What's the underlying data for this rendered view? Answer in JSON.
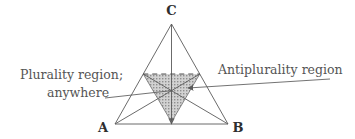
{
  "figure": {
    "background_color": "#ffffff",
    "line_color": "#5a5a5a",
    "shade_fill": "#c9c9c9",
    "text_color": "#555555",
    "vertex_label_color": "#2e2e2e",
    "vertices": [
      {
        "id": "A",
        "label": "A",
        "x": 115,
        "y": 124,
        "label_x": 103,
        "label_y": 131
      },
      {
        "id": "B",
        "label": "B",
        "x": 228,
        "y": 124,
        "label_x": 235,
        "label_y": 131
      },
      {
        "id": "C",
        "label": "C",
        "x": 171.5,
        "y": 24,
        "label_x": 171.5,
        "label_y": 13
      }
    ],
    "midpoints": [
      {
        "id": "M_AC",
        "x": 143.25,
        "y": 74
      },
      {
        "id": "M_BC",
        "x": 199.75,
        "y": 74
      },
      {
        "id": "M_AB",
        "x": 171.5,
        "y": 124
      }
    ],
    "centroid": {
      "x": 171.5,
      "y": 90.7
    },
    "shaded_region": {
      "name": "antiplurality-region",
      "points": "143.25,74 199.75,74 171.5,122",
      "fill": "#c9c9c9",
      "hatch": "dotted-stipple"
    },
    "dashed_segment": {
      "name": "midline-dashed",
      "x1": 143.25,
      "y1": 74,
      "x2": 199.75,
      "y2": 74,
      "dash": "5,4"
    },
    "annotations": [
      {
        "id": "plurality",
        "line1": "Plurality region;",
        "line2": "anywhere",
        "line1_x": 20,
        "line1_y": 75,
        "line2_x": 47,
        "line2_y": 93,
        "leader": {
          "x1": 105,
          "y1": 97,
          "x2": 171,
          "y2": 90.7,
          "arrow": true
        }
      },
      {
        "id": "antiplurality",
        "line1": "Antiplurality region",
        "line1_x": 218,
        "line1_y": 72,
        "leader": {
          "x1": 330,
          "y1": 79,
          "x2": 186,
          "y2": 88,
          "arrow": true
        }
      }
    ]
  }
}
